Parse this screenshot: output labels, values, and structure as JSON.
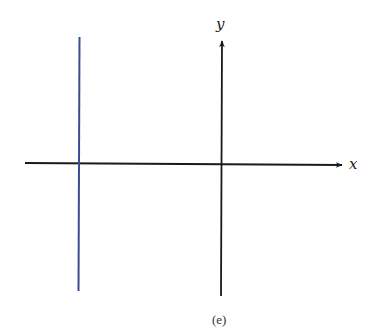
{
  "diagram": {
    "x_axis_label": "x",
    "y_axis_label": "y",
    "caption": "(e)",
    "colors": {
      "axis": "#1a1a1a",
      "graph_line": "#3b4d8f"
    },
    "graph": {
      "description": "vertical line x = c with c < 0",
      "type": "vertical-line"
    }
  }
}
